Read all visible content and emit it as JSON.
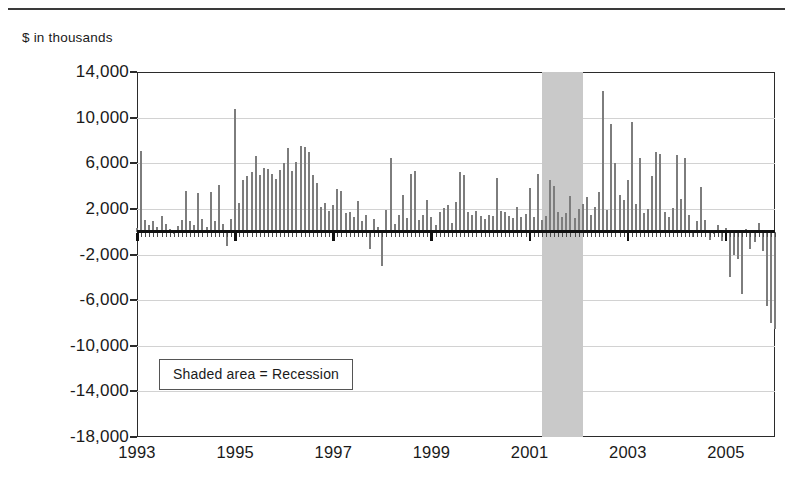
{
  "axis_units_caption": "$ in thousands",
  "legend": {
    "text": "Shaded area = Recession"
  },
  "chart_data": {
    "type": "bar",
    "title": "",
    "subtitle": "",
    "xlabel": "",
    "ylabel": "$ in thousands",
    "ylim": [
      -18000,
      14000
    ],
    "ytick_values": [
      14000,
      10000,
      6000,
      2000,
      -2000,
      -6000,
      -10000,
      -14000,
      -18000
    ],
    "ytick_labels": [
      "14,000",
      "10,000",
      "6,000",
      "2,000",
      "-2,000",
      "-6,000",
      "-10,000",
      "-14,000",
      "-18,000"
    ],
    "xlim": [
      1993.0,
      2006.0
    ],
    "xtick_values": [
      1993,
      1995,
      1997,
      1999,
      2001,
      2003,
      2005
    ],
    "xtick_labels": [
      "1993",
      "1995",
      "1997",
      "1999",
      "2001",
      "2003",
      "2005"
    ],
    "grid": true,
    "legend_position": "inside-lower-left",
    "bar_color": "#7d7d7d",
    "zero_line_color": "#111111",
    "frame_color": "#2b2b2b",
    "gridline_color": "#d2d2d2",
    "shaded_regions": [
      {
        "label": "Recession",
        "x_start": 2001.25,
        "x_end": 2002.08,
        "color": "#c9c9c9"
      }
    ],
    "x_start": 1993.0,
    "x_step": 0.08333,
    "series": [
      {
        "name": "Monthly net flow",
        "values": [
          300,
          7100,
          1050,
          600,
          900,
          450,
          1400,
          700,
          250,
          -200,
          500,
          1000,
          3600,
          900,
          600,
          3350,
          1100,
          400,
          3500,
          950,
          4100,
          700,
          -1250,
          1150,
          10800,
          2500,
          4500,
          4900,
          5200,
          6600,
          5000,
          5600,
          5500,
          5100,
          4600,
          5400,
          6000,
          7300,
          5300,
          6100,
          7500,
          7400,
          7000,
          5000,
          4300,
          2200,
          2500,
          1800,
          2300,
          3700,
          3600,
          1600,
          1700,
          1250,
          2700,
          900,
          1500,
          -1500,
          1100,
          400,
          -3000,
          1900,
          6500,
          700,
          1500,
          3200,
          1200,
          5100,
          5300,
          1000,
          1450,
          2800,
          1300,
          600,
          1700,
          2100,
          2350,
          800,
          2600,
          5200,
          5000,
          1700,
          1500,
          1800,
          1400,
          1150,
          1500,
          1350,
          4700,
          1800,
          1700,
          1400,
          1200,
          2200,
          1300,
          1550,
          3800,
          1250,
          5100,
          1000,
          1350,
          4500,
          4000,
          1700,
          1300,
          1600,
          3100,
          1200,
          2000,
          2400,
          3000,
          1500,
          2200,
          3500,
          12300,
          1900,
          9400,
          6000,
          3200,
          2800,
          4500,
          9600,
          2400,
          6500,
          1600,
          2000,
          4900,
          7000,
          6800,
          1700,
          1300,
          2100,
          6700,
          2900,
          6500,
          1500,
          -500,
          900,
          3900,
          1000,
          -700,
          -200,
          600,
          -800,
          300,
          -4000,
          -2000,
          -2400,
          -5500,
          200,
          -1500,
          -900,
          800,
          -1700,
          -6500,
          -8000,
          -8500,
          -7800,
          -7000,
          -12000,
          -4500,
          -17000,
          -6000,
          -3000,
          -6500,
          -5200,
          -3000,
          -1500,
          700,
          1700,
          7000,
          2100,
          1500,
          6800,
          2200,
          2700,
          6000,
          1400,
          -800,
          900,
          -900,
          7200,
          -1200,
          1100,
          -4200,
          -2000,
          -3500,
          -5000,
          -7200,
          -4000,
          -1600,
          -2000,
          -5100,
          -2200,
          1100,
          900,
          1500,
          2000,
          1600,
          1200,
          2500,
          3800,
          900,
          600,
          4600,
          7000,
          5000,
          7700,
          11500,
          12400,
          10100,
          7000,
          11200,
          3300,
          1200,
          2800,
          -1400,
          2100,
          4400,
          8200,
          4200,
          3400,
          -3200,
          1000,
          1500,
          900,
          1100,
          2400,
          4700,
          6300,
          5900,
          4000,
          6000,
          5100,
          5400,
          8400,
          4600,
          6600,
          6000,
          9500,
          6300,
          7500,
          8500,
          14000,
          10800,
          8400,
          6200,
          5300,
          4200,
          5000
        ]
      }
    ]
  }
}
